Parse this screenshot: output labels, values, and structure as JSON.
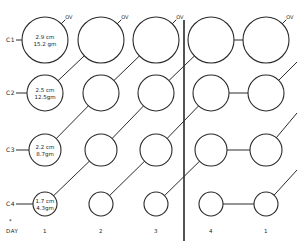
{
  "diagram": {
    "type": "cell-division-growth-diagram",
    "rows": [
      {
        "label": "C1",
        "size": "2.9 cm",
        "weight": "15.2 gm",
        "cy": 40,
        "r": 23
      },
      {
        "label": "C2",
        "size": "2.5 cm",
        "weight": "12.5gm",
        "cy": 93,
        "r": 18
      },
      {
        "label": "C3",
        "size": "2.2 cm",
        "weight": "8.7gm",
        "cy": 150,
        "r": 16
      },
      {
        "label": "C4",
        "size": "1.7 cm",
        "weight": "4.3gm",
        "cy": 204,
        "r": 12
      }
    ],
    "columns_x": [
      45,
      101,
      156,
      211,
      266
    ],
    "ov_label": "OV",
    "ov_columns": [
      0,
      1,
      2,
      4
    ],
    "day_marker": "*",
    "day_label": "DAY",
    "days": [
      "1",
      "2",
      "3",
      "4",
      "1"
    ],
    "divider_x": 184
  }
}
